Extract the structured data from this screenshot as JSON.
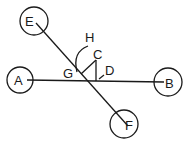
{
  "diagram": {
    "nodes": [
      {
        "id": "A",
        "label": "A",
        "cx": 20,
        "cy": 80,
        "r": 13
      },
      {
        "id": "B",
        "label": "B",
        "cx": 168,
        "cy": 82,
        "r": 14
      },
      {
        "id": "E",
        "label": "E",
        "cx": 34,
        "cy": 21,
        "r": 14
      },
      {
        "id": "F",
        "label": "F",
        "cx": 124,
        "cy": 124,
        "r": 14
      }
    ],
    "lines": [
      {
        "from": "A",
        "to": "B"
      },
      {
        "from": "E",
        "to": "F"
      }
    ],
    "angle_labels": {
      "C": "C",
      "D": "D",
      "G": "G",
      "H": "H"
    }
  }
}
